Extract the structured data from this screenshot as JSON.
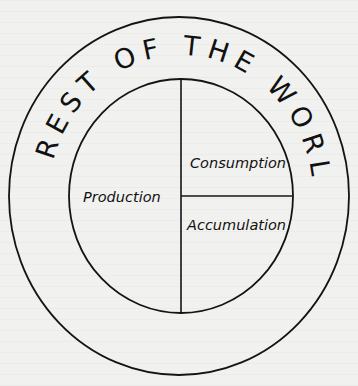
{
  "diagram": {
    "outer_label": "REST OF THE WORLD",
    "sectors": {
      "left": "Production",
      "top_right": "Consumption",
      "bottom_right": "Accumulation"
    },
    "colors": {
      "background": "#f1f1f0",
      "stroke": "#141414",
      "text": "#111111"
    }
  }
}
